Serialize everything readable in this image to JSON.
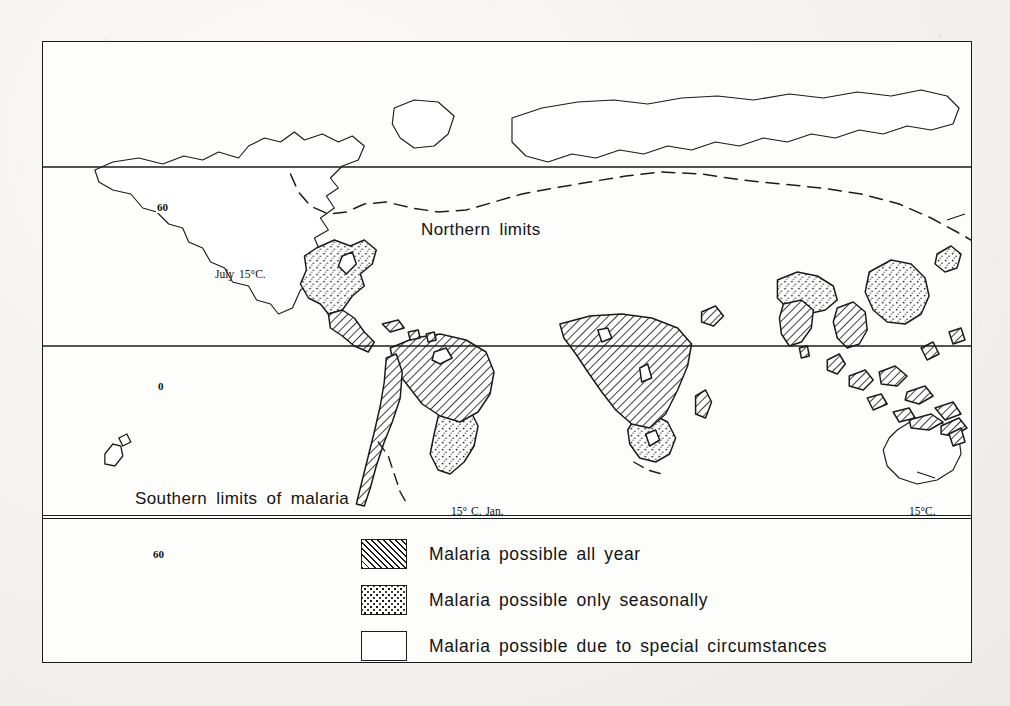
{
  "figure": {
    "kind": "thematic world map"
  },
  "map": {
    "labels": {
      "northern_limits": "Northern limits",
      "southern_limits": "Southern limits of malaria",
      "july_isotherm": "July 15°C.",
      "january_isotherm": "15° C. Jan.",
      "australia_isotherm": "15°C.",
      "east_asia_isotherm": "15°C"
    },
    "latitudes": [
      {
        "name": "sixty-north",
        "label": "60"
      },
      {
        "name": "equator",
        "label": "0"
      },
      {
        "name": "sixty-south",
        "label": "60"
      }
    ],
    "projection_note": "cylindrical world outline"
  },
  "legend": {
    "items": [
      {
        "pattern": "hatch",
        "label": "Malaria possible all year"
      },
      {
        "pattern": "stipple",
        "label": "Malaria possible only seasonally"
      },
      {
        "pattern": "blank",
        "label": "Malaria possible due to special circumstances"
      }
    ]
  },
  "colors": {
    "ink": "#1b1b1b",
    "paper": "#fdfdfb",
    "page": "#f2f1ee"
  }
}
